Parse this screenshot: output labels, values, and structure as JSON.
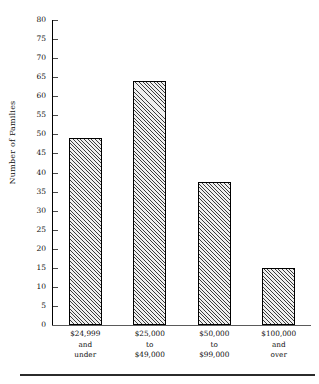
{
  "chart_data": {
    "type": "bar",
    "title": "",
    "xlabel": "",
    "ylabel": "Number of Families",
    "categories": [
      "$24,999 and under",
      "$25,000 to $49,000",
      "$50,000 to $99,000",
      "$100,000 and over"
    ],
    "category_lines": [
      [
        "$24,999",
        "and",
        "under"
      ],
      [
        "$25,000",
        "to",
        "$49,000"
      ],
      [
        "$50,000",
        "to",
        "$99,000"
      ],
      [
        "$100,000",
        "and",
        "over"
      ]
    ],
    "values": [
      49,
      64,
      37.5,
      15
    ],
    "ylim": [
      0,
      80
    ],
    "ytick_step": 5,
    "yticks": [
      0,
      5,
      10,
      15,
      20,
      25,
      30,
      35,
      40,
      45,
      50,
      55,
      60,
      65,
      70,
      75,
      80
    ],
    "ytick_labels": [
      "0",
      "5",
      "10",
      "15",
      "20",
      "25",
      "30",
      "35",
      "40",
      "45",
      "50",
      "55",
      "60",
      "65",
      "70",
      "75",
      "80"
    ],
    "grid": false,
    "legend": false,
    "bar_fill": "diagonal-hatch",
    "bar_outline_color": "#000000",
    "axis_color": "#000000",
    "background": "#ffffff"
  },
  "figure": {
    "bottom_rule": true
  }
}
